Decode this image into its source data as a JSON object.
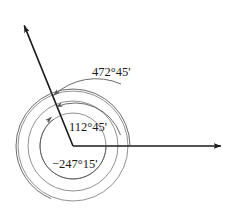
{
  "figure": {
    "type": "angle-diagram",
    "background_color": "#ffffff",
    "ray_color": "#1a1a1a",
    "arc_color": "#5a5a5a",
    "text_color": "#1a1a1a"
  },
  "vertex": {
    "x": 73,
    "y": 146
  },
  "rays": [
    {
      "name": "initial-side",
      "label": "",
      "from_x": 73,
      "from_y": 146,
      "to_x": 224,
      "to_y": 146,
      "angle_degrees": 0,
      "arrowhead": true
    },
    {
      "name": "terminal-side",
      "label": "",
      "from_x": 73,
      "from_y": 146,
      "to_x": 22,
      "to_y": 20,
      "angle_degrees": 112.75,
      "arrowhead": true
    }
  ],
  "arcs": [
    {
      "name": "outer-arc",
      "label": "472°45'",
      "degrees": 472.75,
      "radius": 55,
      "direction": "counterclockwise",
      "label_x": 92,
      "label_y": 76
    },
    {
      "name": "middle-arc",
      "label": "112°45'",
      "degrees": 112.75,
      "radius": 45,
      "direction": "counterclockwise",
      "label_x": 69,
      "label_y": 131
    },
    {
      "name": "inner-arc",
      "label": "−247°15'",
      "degrees": -247.25,
      "radius": 33,
      "direction": "clockwise",
      "label_x": 52,
      "label_y": 168
    }
  ],
  "circles": [
    {
      "name": "outer-circle",
      "radius": 55
    },
    {
      "name": "middle-circle",
      "radius": 45
    },
    {
      "name": "inner-circle",
      "radius": 33
    }
  ]
}
